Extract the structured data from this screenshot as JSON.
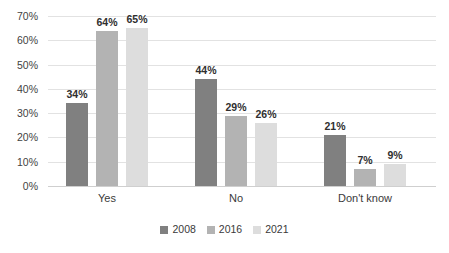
{
  "chart_data": {
    "type": "bar",
    "title": "",
    "subtitle": "",
    "xlabel": "",
    "ylabel": "",
    "categories": [
      "Yes",
      "No",
      "Don't know"
    ],
    "series": [
      {
        "name": "2008",
        "color": "#808080",
        "values": [
          34,
          44,
          21
        ],
        "labels": [
          "34%",
          "44%",
          "21%"
        ]
      },
      {
        "name": "2016",
        "color": "#b3b3b3",
        "values": [
          64,
          29,
          7
        ],
        "labels": [
          "64%",
          "29%",
          "7%"
        ]
      },
      {
        "name": "2021",
        "color": "#dddddd",
        "values": [
          65,
          26,
          9
        ],
        "labels": [
          "65%",
          "26%",
          "9%"
        ]
      }
    ],
    "ylim": [
      0,
      70
    ],
    "ytick_values": [
      0,
      10,
      20,
      30,
      40,
      50,
      60,
      70
    ],
    "ytick_labels": [
      "0%",
      "10%",
      "20%",
      "30%",
      "40%",
      "50%",
      "60%",
      "70%"
    ],
    "grid": true,
    "legend_position": "bottom",
    "value_format": "percent"
  },
  "axis": {
    "y_labels": [
      "70%",
      "60%",
      "50%",
      "40%",
      "30%",
      "20%",
      "10%",
      "0%"
    ],
    "x_labels": [
      "Yes",
      "No",
      "Don't know"
    ]
  },
  "legend": {
    "items": [
      {
        "label": "2008",
        "color": "#808080"
      },
      {
        "label": "2016",
        "color": "#b3b3b3"
      },
      {
        "label": "2021",
        "color": "#dddddd"
      }
    ]
  },
  "colors": {
    "series_2008": "#808080",
    "series_2016": "#b3b3b3",
    "series_2021": "#dddddd",
    "gridline": "#e2e2e2",
    "baseline": "#cfcfcf",
    "text": "#3a3a3a",
    "background": "#ffffff"
  }
}
